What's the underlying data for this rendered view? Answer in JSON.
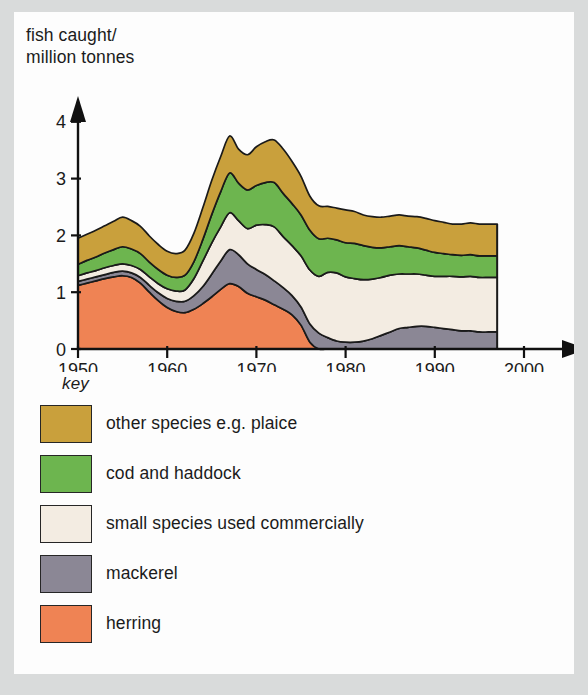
{
  "chart_data": {
    "type": "area",
    "stacked": true,
    "title": "",
    "ylabel": "fish caught/\nmillion tonnes",
    "xlabel": "",
    "xlim": [
      1950,
      2000
    ],
    "ylim": [
      0,
      4.35
    ],
    "yticks": [
      0,
      1,
      2,
      3,
      4
    ],
    "ytick_labels": [
      "0",
      "1",
      "2",
      "3",
      "4"
    ],
    "xticks": [
      1950,
      1960,
      1970,
      1980,
      1990,
      2000
    ],
    "xtick_labels": [
      "1950",
      "1960",
      "1970",
      "1980",
      "1990",
      "2000"
    ],
    "grid": false,
    "legend_position": "below-plot",
    "legend_title": "key",
    "data_end_year": 1997,
    "x": [
      1950,
      1951,
      1952,
      1953,
      1954,
      1955,
      1956,
      1957,
      1958,
      1959,
      1960,
      1961,
      1962,
      1963,
      1964,
      1965,
      1966,
      1967,
      1968,
      1969,
      1970,
      1971,
      1972,
      1973,
      1974,
      1975,
      1976,
      1977,
      1978,
      1979,
      1980,
      1981,
      1982,
      1983,
      1984,
      1985,
      1986,
      1987,
      1988,
      1989,
      1990,
      1991,
      1992,
      1993,
      1994,
      1995,
      1996,
      1997
    ],
    "series": [
      {
        "name": "herring",
        "color": "#ef8354",
        "values": [
          1.12,
          1.16,
          1.2,
          1.24,
          1.27,
          1.29,
          1.26,
          1.16,
          1.0,
          0.85,
          0.73,
          0.66,
          0.64,
          0.7,
          0.8,
          0.92,
          1.05,
          1.15,
          1.1,
          0.98,
          0.92,
          0.86,
          0.78,
          0.7,
          0.6,
          0.42,
          0.12,
          0.0,
          0.0,
          0.0,
          0.0,
          0.0,
          0.0,
          0.0,
          0.0,
          0.0,
          0.0,
          0.0,
          0.0,
          0.0,
          0.0,
          0.0,
          0.0,
          0.0,
          0.0,
          0.0,
          0.0,
          0.0
        ]
      },
      {
        "name": "mackerel",
        "color": "#8b8795",
        "values": [
          0.07,
          0.07,
          0.07,
          0.07,
          0.08,
          0.08,
          0.08,
          0.1,
          0.12,
          0.14,
          0.16,
          0.18,
          0.2,
          0.24,
          0.3,
          0.4,
          0.5,
          0.6,
          0.56,
          0.52,
          0.48,
          0.45,
          0.42,
          0.38,
          0.34,
          0.32,
          0.32,
          0.28,
          0.2,
          0.14,
          0.12,
          0.12,
          0.14,
          0.18,
          0.24,
          0.3,
          0.36,
          0.38,
          0.4,
          0.4,
          0.38,
          0.36,
          0.34,
          0.32,
          0.32,
          0.3,
          0.3,
          0.3
        ]
      },
      {
        "name": "small species used commercially",
        "color": "#f3ece2",
        "values": [
          0.1,
          0.11,
          0.11,
          0.12,
          0.12,
          0.13,
          0.13,
          0.14,
          0.15,
          0.16,
          0.17,
          0.18,
          0.2,
          0.3,
          0.45,
          0.55,
          0.6,
          0.65,
          0.6,
          0.62,
          0.78,
          0.88,
          0.95,
          0.9,
          0.88,
          0.9,
          0.95,
          1.0,
          1.15,
          1.2,
          1.15,
          1.12,
          1.08,
          1.05,
          1.02,
          1.0,
          0.96,
          0.94,
          0.92,
          0.9,
          0.9,
          0.92,
          0.94,
          0.95,
          0.96,
          0.96,
          0.96,
          0.96
        ]
      },
      {
        "name": "cod and haddock",
        "color": "#6db54f",
        "values": [
          0.2,
          0.22,
          0.24,
          0.26,
          0.28,
          0.3,
          0.29,
          0.28,
          0.26,
          0.25,
          0.24,
          0.24,
          0.26,
          0.3,
          0.38,
          0.5,
          0.62,
          0.7,
          0.66,
          0.68,
          0.7,
          0.74,
          0.78,
          0.76,
          0.74,
          0.72,
          0.7,
          0.66,
          0.6,
          0.58,
          0.6,
          0.62,
          0.6,
          0.56,
          0.52,
          0.5,
          0.5,
          0.48,
          0.46,
          0.44,
          0.42,
          0.4,
          0.38,
          0.38,
          0.38,
          0.38,
          0.38,
          0.38
        ]
      },
      {
        "name": "other species e.g. plaice",
        "color": "#c9a03c",
        "values": [
          0.46,
          0.46,
          0.47,
          0.48,
          0.5,
          0.52,
          0.5,
          0.48,
          0.46,
          0.44,
          0.42,
          0.42,
          0.44,
          0.5,
          0.56,
          0.6,
          0.62,
          0.65,
          0.6,
          0.62,
          0.68,
          0.72,
          0.75,
          0.78,
          0.74,
          0.68,
          0.6,
          0.58,
          0.56,
          0.56,
          0.58,
          0.56,
          0.54,
          0.54,
          0.54,
          0.54,
          0.54,
          0.54,
          0.55,
          0.56,
          0.56,
          0.55,
          0.54,
          0.55,
          0.56,
          0.56,
          0.56,
          0.56
        ]
      }
    ]
  },
  "axis": {
    "y_title_line1": "fish caught/",
    "y_title_line2": "million tonnes"
  },
  "legend": {
    "title": "key",
    "items": [
      {
        "label": "other species e.g. plaice",
        "color": "#c9a03c"
      },
      {
        "label": "cod and haddock",
        "color": "#6db54f"
      },
      {
        "label": "small species used commercially",
        "color": "#f3ece2"
      },
      {
        "label": "mackerel",
        "color": "#8b8795"
      },
      {
        "label": "herring",
        "color": "#ef8354"
      }
    ]
  }
}
